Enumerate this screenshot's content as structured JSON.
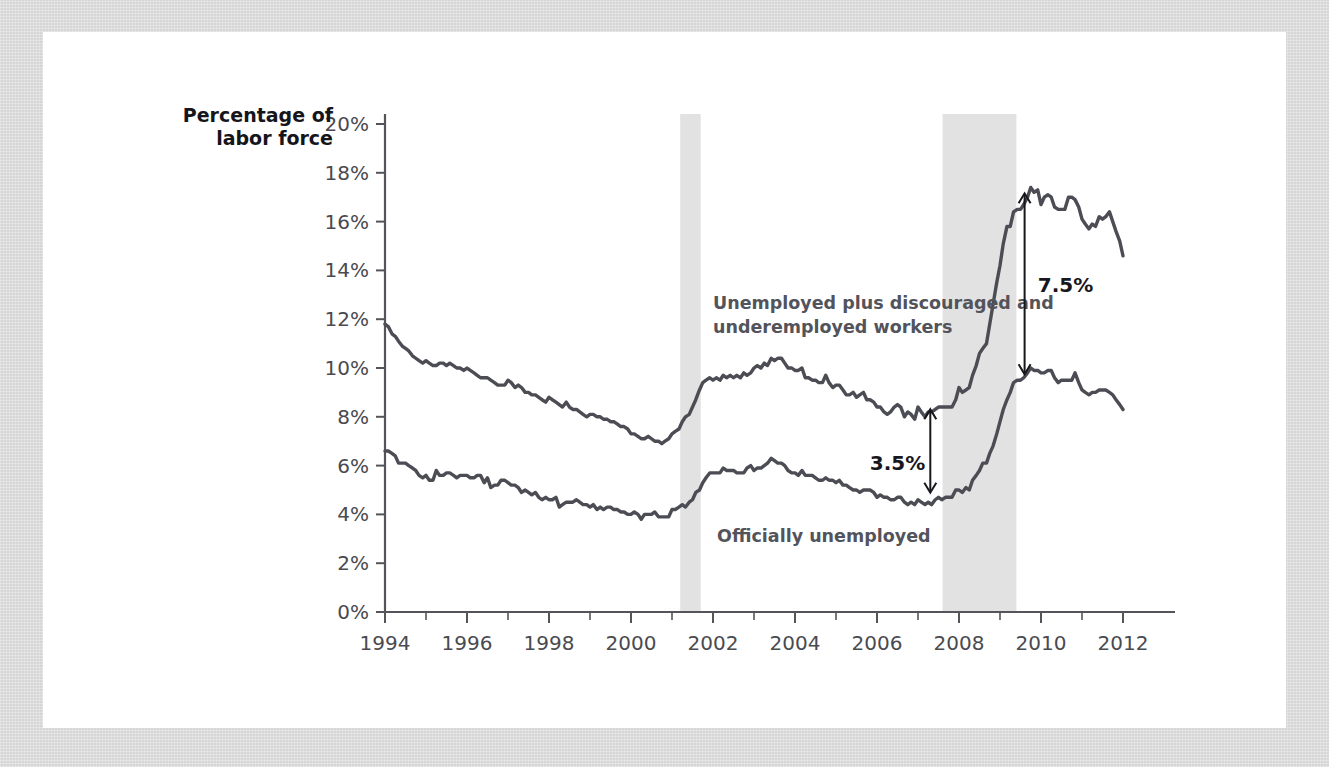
{
  "page": {
    "background_color": "#d6d6d6",
    "paper_color": "#ffffff"
  },
  "chart_data": {
    "type": "line",
    "title": "",
    "subtitle": "",
    "xlabel": "",
    "ylabel": "Percentage of labor force",
    "ylabel_line1": "Percentage of",
    "ylabel_line2": "labor force",
    "xlim": [
      1994,
      2012
    ],
    "ylim": [
      0,
      20
    ],
    "grid": false,
    "legend_position": "inline-annotations",
    "y_ticks": [
      "0%",
      "2%",
      "4%",
      "6%",
      "8%",
      "10%",
      "12%",
      "14%",
      "16%",
      "18%",
      "20%"
    ],
    "y_tick_values": [
      0,
      2,
      4,
      6,
      8,
      10,
      12,
      14,
      16,
      18,
      20
    ],
    "x_ticks": [
      "1994",
      "1996",
      "1998",
      "2000",
      "2002",
      "2004",
      "2006",
      "2008",
      "2010",
      "2012"
    ],
    "x_tick_values": [
      1994,
      1996,
      1998,
      2000,
      2002,
      2004,
      2006,
      2008,
      2010,
      2012
    ],
    "x_minor_tick_values": [
      1995,
      1997,
      1999,
      2001,
      2003,
      2005,
      2007,
      2009,
      2011
    ],
    "series": [
      {
        "name": "Unemployed plus discouraged and underemployed workers",
        "label": "Unemployed plus discouraged and\nunderemployed workers",
        "label_line1": "Unemployed plus discouraged and",
        "label_line2": "underemployed workers",
        "color": "#4c4c54",
        "x": [
          1994.0,
          1994.08,
          1994.17,
          1994.25,
          1994.33,
          1994.42,
          1994.5,
          1994.58,
          1994.67,
          1994.75,
          1994.83,
          1994.92,
          1995.0,
          1995.08,
          1995.17,
          1995.25,
          1995.33,
          1995.42,
          1995.5,
          1995.58,
          1995.67,
          1995.75,
          1995.83,
          1995.92,
          1996.0,
          1996.08,
          1996.17,
          1996.25,
          1996.33,
          1996.42,
          1996.5,
          1996.58,
          1996.67,
          1996.75,
          1996.83,
          1996.92,
          1997.0,
          1997.08,
          1997.17,
          1997.25,
          1997.33,
          1997.42,
          1997.5,
          1997.58,
          1997.67,
          1997.75,
          1997.83,
          1997.92,
          1998.0,
          1998.08,
          1998.17,
          1998.25,
          1998.33,
          1998.42,
          1998.5,
          1998.58,
          1998.67,
          1998.75,
          1998.83,
          1998.92,
          1999.0,
          1999.08,
          1999.17,
          1999.25,
          1999.33,
          1999.42,
          1999.5,
          1999.58,
          1999.67,
          1999.75,
          1999.83,
          1999.92,
          2000.0,
          2000.08,
          2000.17,
          2000.25,
          2000.33,
          2000.42,
          2000.5,
          2000.58,
          2000.67,
          2000.75,
          2000.83,
          2000.92,
          2001.0,
          2001.08,
          2001.17,
          2001.25,
          2001.33,
          2001.42,
          2001.5,
          2001.58,
          2001.67,
          2001.75,
          2001.83,
          2001.92,
          2002.0,
          2002.08,
          2002.17,
          2002.25,
          2002.33,
          2002.42,
          2002.5,
          2002.58,
          2002.67,
          2002.75,
          2002.83,
          2002.92,
          2003.0,
          2003.08,
          2003.17,
          2003.25,
          2003.33,
          2003.42,
          2003.5,
          2003.58,
          2003.67,
          2003.75,
          2003.83,
          2003.92,
          2004.0,
          2004.08,
          2004.17,
          2004.25,
          2004.33,
          2004.42,
          2004.5,
          2004.58,
          2004.67,
          2004.75,
          2004.83,
          2004.92,
          2005.0,
          2005.08,
          2005.17,
          2005.25,
          2005.33,
          2005.42,
          2005.5,
          2005.58,
          2005.67,
          2005.75,
          2005.83,
          2005.92,
          2006.0,
          2006.08,
          2006.17,
          2006.25,
          2006.33,
          2006.42,
          2006.5,
          2006.58,
          2006.67,
          2006.75,
          2006.83,
          2006.92,
          2007.0,
          2007.08,
          2007.17,
          2007.25,
          2007.33,
          2007.42,
          2007.5,
          2007.58,
          2007.67,
          2007.75,
          2007.83,
          2007.92,
          2008.0,
          2008.08,
          2008.17,
          2008.25,
          2008.33,
          2008.42,
          2008.5,
          2008.58,
          2008.67,
          2008.75,
          2008.83,
          2008.92,
          2009.0,
          2009.08,
          2009.17,
          2009.25,
          2009.33,
          2009.42,
          2009.5,
          2009.58,
          2009.67,
          2009.75,
          2009.83,
          2009.92,
          2010.0,
          2010.08,
          2010.17,
          2010.25,
          2010.33,
          2010.42,
          2010.5,
          2010.58,
          2010.67,
          2010.75,
          2010.83,
          2010.92,
          2011.0,
          2011.08,
          2011.17,
          2011.25,
          2011.33,
          2011.42,
          2011.5,
          2011.58,
          2011.67,
          2011.75,
          2011.83,
          2011.92,
          2012.0
        ],
        "values": [
          11.8,
          11.7,
          11.4,
          11.3,
          11.1,
          10.9,
          10.8,
          10.7,
          10.5,
          10.4,
          10.3,
          10.2,
          10.3,
          10.2,
          10.1,
          10.1,
          10.2,
          10.2,
          10.1,
          10.2,
          10.1,
          10.0,
          10.0,
          9.9,
          10.0,
          9.9,
          9.8,
          9.7,
          9.6,
          9.6,
          9.6,
          9.5,
          9.4,
          9.3,
          9.3,
          9.3,
          9.5,
          9.4,
          9.2,
          9.3,
          9.2,
          9.0,
          9.0,
          8.9,
          8.9,
          8.8,
          8.7,
          8.6,
          8.8,
          8.7,
          8.6,
          8.5,
          8.4,
          8.6,
          8.4,
          8.3,
          8.3,
          8.2,
          8.1,
          8.0,
          8.1,
          8.1,
          8.0,
          8.0,
          7.9,
          7.9,
          7.8,
          7.8,
          7.7,
          7.6,
          7.6,
          7.5,
          7.3,
          7.3,
          7.2,
          7.1,
          7.1,
          7.2,
          7.1,
          7.0,
          7.0,
          6.9,
          7.0,
          7.1,
          7.3,
          7.4,
          7.5,
          7.8,
          8.0,
          8.1,
          8.4,
          8.7,
          9.1,
          9.4,
          9.5,
          9.6,
          9.5,
          9.6,
          9.5,
          9.7,
          9.6,
          9.7,
          9.6,
          9.7,
          9.6,
          9.8,
          9.7,
          9.8,
          10.0,
          10.1,
          10.0,
          10.2,
          10.1,
          10.4,
          10.3,
          10.4,
          10.4,
          10.2,
          10.0,
          10.0,
          9.9,
          9.9,
          10.0,
          9.6,
          9.6,
          9.5,
          9.5,
          9.4,
          9.4,
          9.7,
          9.4,
          9.2,
          9.3,
          9.3,
          9.1,
          8.9,
          8.9,
          9.0,
          8.8,
          8.9,
          9.0,
          8.7,
          8.7,
          8.6,
          8.4,
          8.4,
          8.2,
          8.1,
          8.2,
          8.4,
          8.5,
          8.4,
          8.0,
          8.2,
          8.1,
          7.9,
          8.4,
          8.2,
          8.0,
          8.2,
          8.2,
          8.3,
          8.4,
          8.4,
          8.4,
          8.4,
          8.4,
          8.7,
          9.2,
          9.0,
          9.1,
          9.2,
          9.7,
          10.1,
          10.6,
          10.8,
          11.0,
          11.8,
          12.6,
          13.5,
          14.2,
          15.1,
          15.8,
          15.8,
          16.4,
          16.5,
          16.5,
          16.7,
          17.0,
          17.4,
          17.2,
          17.3,
          16.7,
          17.0,
          17.1,
          17.0,
          16.6,
          16.5,
          16.5,
          16.5,
          17.0,
          17.0,
          16.9,
          16.6,
          16.1,
          15.9,
          15.7,
          15.9,
          15.8,
          16.2,
          16.1,
          16.2,
          16.4,
          16.0,
          15.6,
          15.2,
          14.6
        ]
      },
      {
        "name": "Officially unemployed",
        "label": "Officially unemployed",
        "color": "#4c4c54",
        "x": [
          1994.0,
          1994.08,
          1994.17,
          1994.25,
          1994.33,
          1994.42,
          1994.5,
          1994.58,
          1994.67,
          1994.75,
          1994.83,
          1994.92,
          1995.0,
          1995.08,
          1995.17,
          1995.25,
          1995.33,
          1995.42,
          1995.5,
          1995.58,
          1995.67,
          1995.75,
          1995.83,
          1995.92,
          1996.0,
          1996.08,
          1996.17,
          1996.25,
          1996.33,
          1996.42,
          1996.5,
          1996.58,
          1996.67,
          1996.75,
          1996.83,
          1996.92,
          1997.0,
          1997.08,
          1997.17,
          1997.25,
          1997.33,
          1997.42,
          1997.5,
          1997.58,
          1997.67,
          1997.75,
          1997.83,
          1997.92,
          1998.0,
          1998.08,
          1998.17,
          1998.25,
          1998.33,
          1998.42,
          1998.5,
          1998.58,
          1998.67,
          1998.75,
          1998.83,
          1998.92,
          1999.0,
          1999.08,
          1999.17,
          1999.25,
          1999.33,
          1999.42,
          1999.5,
          1999.58,
          1999.67,
          1999.75,
          1999.83,
          1999.92,
          2000.0,
          2000.08,
          2000.17,
          2000.25,
          2000.33,
          2000.42,
          2000.5,
          2000.58,
          2000.67,
          2000.75,
          2000.83,
          2000.92,
          2001.0,
          2001.08,
          2001.17,
          2001.25,
          2001.33,
          2001.42,
          2001.5,
          2001.58,
          2001.67,
          2001.75,
          2001.83,
          2001.92,
          2002.0,
          2002.08,
          2002.17,
          2002.25,
          2002.33,
          2002.42,
          2002.5,
          2002.58,
          2002.67,
          2002.75,
          2002.83,
          2002.92,
          2003.0,
          2003.08,
          2003.17,
          2003.25,
          2003.33,
          2003.42,
          2003.5,
          2003.58,
          2003.67,
          2003.75,
          2003.83,
          2003.92,
          2004.0,
          2004.08,
          2004.17,
          2004.25,
          2004.33,
          2004.42,
          2004.5,
          2004.58,
          2004.67,
          2004.75,
          2004.83,
          2004.92,
          2005.0,
          2005.08,
          2005.17,
          2005.25,
          2005.33,
          2005.42,
          2005.5,
          2005.58,
          2005.67,
          2005.75,
          2005.83,
          2005.92,
          2006.0,
          2006.08,
          2006.17,
          2006.25,
          2006.33,
          2006.42,
          2006.5,
          2006.58,
          2006.67,
          2006.75,
          2006.83,
          2006.92,
          2007.0,
          2007.08,
          2007.17,
          2007.25,
          2007.33,
          2007.42,
          2007.5,
          2007.58,
          2007.67,
          2007.75,
          2007.83,
          2007.92,
          2008.0,
          2008.08,
          2008.17,
          2008.25,
          2008.33,
          2008.42,
          2008.5,
          2008.58,
          2008.67,
          2008.75,
          2008.83,
          2008.92,
          2009.0,
          2009.08,
          2009.17,
          2009.25,
          2009.33,
          2009.42,
          2009.5,
          2009.58,
          2009.67,
          2009.75,
          2009.83,
          2009.92,
          2010.0,
          2010.08,
          2010.17,
          2010.25,
          2010.33,
          2010.42,
          2010.5,
          2010.58,
          2010.67,
          2010.75,
          2010.83,
          2010.92,
          2011.0,
          2011.08,
          2011.17,
          2011.25,
          2011.33,
          2011.42,
          2011.5,
          2011.58,
          2011.67,
          2011.75,
          2011.83,
          2011.92,
          2012.0
        ],
        "values": [
          6.6,
          6.6,
          6.5,
          6.4,
          6.1,
          6.1,
          6.1,
          6.0,
          5.9,
          5.8,
          5.6,
          5.5,
          5.6,
          5.4,
          5.4,
          5.8,
          5.6,
          5.6,
          5.7,
          5.7,
          5.6,
          5.5,
          5.6,
          5.6,
          5.6,
          5.5,
          5.5,
          5.6,
          5.6,
          5.3,
          5.5,
          5.1,
          5.2,
          5.2,
          5.4,
          5.4,
          5.3,
          5.2,
          5.2,
          5.1,
          4.9,
          5.0,
          4.9,
          4.8,
          4.9,
          4.7,
          4.6,
          4.7,
          4.6,
          4.6,
          4.7,
          4.3,
          4.4,
          4.5,
          4.5,
          4.5,
          4.6,
          4.5,
          4.4,
          4.4,
          4.3,
          4.4,
          4.2,
          4.3,
          4.2,
          4.3,
          4.3,
          4.2,
          4.2,
          4.1,
          4.1,
          4.0,
          4.0,
          4.1,
          4.0,
          3.8,
          4.0,
          4.0,
          4.0,
          4.1,
          3.9,
          3.9,
          3.9,
          3.9,
          4.2,
          4.2,
          4.3,
          4.4,
          4.3,
          4.5,
          4.6,
          4.9,
          5.0,
          5.3,
          5.5,
          5.7,
          5.7,
          5.7,
          5.7,
          5.9,
          5.8,
          5.8,
          5.8,
          5.7,
          5.7,
          5.7,
          5.9,
          6.0,
          5.8,
          5.9,
          5.9,
          6.0,
          6.1,
          6.3,
          6.2,
          6.1,
          6.1,
          6.0,
          5.8,
          5.7,
          5.7,
          5.6,
          5.8,
          5.6,
          5.6,
          5.6,
          5.5,
          5.4,
          5.4,
          5.5,
          5.4,
          5.4,
          5.3,
          5.4,
          5.2,
          5.2,
          5.1,
          5.0,
          5.0,
          4.9,
          5.0,
          5.0,
          5.0,
          4.9,
          4.7,
          4.8,
          4.7,
          4.7,
          4.6,
          4.6,
          4.7,
          4.7,
          4.5,
          4.4,
          4.5,
          4.4,
          4.6,
          4.5,
          4.4,
          4.5,
          4.4,
          4.6,
          4.7,
          4.6,
          4.7,
          4.7,
          4.7,
          5.0,
          5.0,
          4.9,
          5.1,
          5.0,
          5.4,
          5.6,
          5.8,
          6.1,
          6.1,
          6.5,
          6.8,
          7.3,
          7.8,
          8.3,
          8.7,
          9.0,
          9.4,
          9.5,
          9.5,
          9.6,
          9.8,
          10.0,
          9.9,
          9.9,
          9.8,
          9.8,
          9.9,
          9.9,
          9.6,
          9.4,
          9.5,
          9.5,
          9.5,
          9.5,
          9.8,
          9.4,
          9.1,
          9.0,
          8.9,
          9.0,
          9.0,
          9.1,
          9.1,
          9.1,
          9.0,
          8.9,
          8.7,
          8.5,
          8.3
        ]
      }
    ],
    "annotations": [
      {
        "name": "gap-2007",
        "text": "3.5%",
        "x": 2007.3,
        "y_top": 8.35,
        "y_bottom": 4.85,
        "label_x": 2006.5,
        "label_y": 6.1
      },
      {
        "name": "gap-2009",
        "text": "7.5%",
        "x": 2009.6,
        "y_top": 17.2,
        "y_bottom": 9.7,
        "label_x": 2010.6,
        "label_y": 13.4
      }
    ],
    "recession_bands": [
      {
        "name": "recession-2001",
        "start": 2001.2,
        "end": 2001.7,
        "color": "#e2e2e2"
      },
      {
        "name": "recession-2008",
        "start": 2007.6,
        "end": 2009.4,
        "color": "#e2e2e2"
      }
    ],
    "series_label_positions": [
      {
        "series": 0,
        "x": 2002.0,
        "y": 12.4
      },
      {
        "series": 1,
        "x": 2002.1,
        "y": 2.85
      }
    ]
  }
}
